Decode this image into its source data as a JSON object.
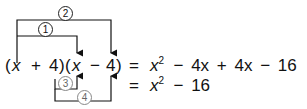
{
  "diagram": {
    "left_expression": {
      "open1": "(",
      "x1": "x",
      "plus": "+",
      "four1": "4",
      "close1": ")",
      "open2": "(",
      "x2": "x",
      "minus": "−",
      "four2": "4",
      "close2": ")"
    },
    "equals": "=",
    "line1": {
      "x": "x",
      "exp": "2",
      "rest": "− 4x + 4x − 16"
    },
    "line2": {
      "x": "x",
      "exp": "2",
      "rest": "− 16"
    },
    "labels": [
      "1",
      "2",
      "3",
      "4"
    ],
    "colors": {
      "ink": "#111111",
      "secondary": "#888888"
    }
  }
}
